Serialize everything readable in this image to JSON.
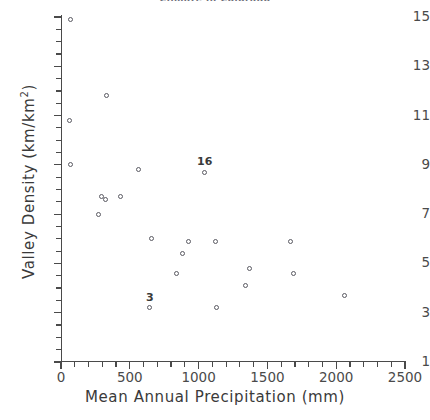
{
  "chart_data": {
    "type": "scatter",
    "title": "Climate in Colorado",
    "xlabel": "Mean  Annual  Precipitation  (mm)",
    "ylabel": "Valley  Density  (km/km2)",
    "ylabel_main": "Valley  Density   (km/km",
    "ylabel_sup": "2",
    "ylabel_close": ")",
    "xlim": [
      0,
      2500
    ],
    "ylim": [
      1,
      15
    ],
    "xticks": [
      0,
      500,
      1000,
      1500,
      2000,
      2500
    ],
    "yticks": [
      1,
      3,
      5,
      7,
      9,
      11,
      13,
      15
    ],
    "x_minor_step": 100,
    "y_minor_step": 0.5,
    "grid": false,
    "legend": "none",
    "marker": "open-circle",
    "marker_color": "#5a5a62",
    "points": [
      {
        "x": 70,
        "y": 14.9,
        "label": ""
      },
      {
        "x": 60,
        "y": 10.8,
        "label": ""
      },
      {
        "x": 330,
        "y": 11.8,
        "label": ""
      },
      {
        "x": 70,
        "y": 9.0,
        "label": ""
      },
      {
        "x": 560,
        "y": 8.8,
        "label": ""
      },
      {
        "x": 1040,
        "y": 8.7,
        "label": "16"
      },
      {
        "x": 295,
        "y": 7.7,
        "label": ""
      },
      {
        "x": 320,
        "y": 7.6,
        "label": ""
      },
      {
        "x": 430,
        "y": 7.7,
        "label": ""
      },
      {
        "x": 270,
        "y": 7.0,
        "label": ""
      },
      {
        "x": 660,
        "y": 6.0,
        "label": ""
      },
      {
        "x": 930,
        "y": 5.9,
        "label": ""
      },
      {
        "x": 1120,
        "y": 5.9,
        "label": ""
      },
      {
        "x": 1670,
        "y": 5.9,
        "label": ""
      },
      {
        "x": 880,
        "y": 5.4,
        "label": ""
      },
      {
        "x": 840,
        "y": 4.6,
        "label": ""
      },
      {
        "x": 1370,
        "y": 4.8,
        "label": ""
      },
      {
        "x": 1690,
        "y": 4.6,
        "label": ""
      },
      {
        "x": 1340,
        "y": 4.1,
        "label": ""
      },
      {
        "x": 2060,
        "y": 3.7,
        "label": ""
      },
      {
        "x": 640,
        "y": 3.2,
        "label": "3"
      },
      {
        "x": 1130,
        "y": 3.2,
        "label": ""
      }
    ]
  }
}
